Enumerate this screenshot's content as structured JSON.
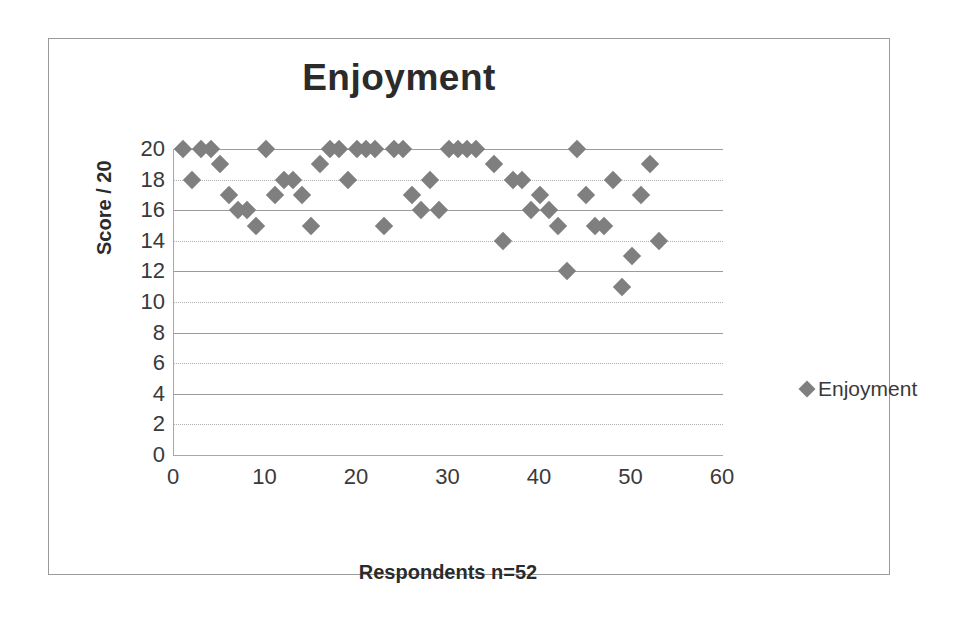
{
  "chart_data": {
    "type": "scatter",
    "title": "Enjoyment",
    "xlabel": "Respondents n=52",
    "ylabel": "Score / 20",
    "xlim": [
      0,
      60
    ],
    "ylim": [
      0,
      20
    ],
    "xticks": [
      0,
      10,
      20,
      30,
      40,
      50,
      60
    ],
    "yticks": [
      0,
      2,
      4,
      6,
      8,
      10,
      12,
      14,
      16,
      18,
      20
    ],
    "grid": "horizontal",
    "legend_position": "right",
    "marker": "diamond",
    "marker_color": "#7f7f7f",
    "series": [
      {
        "name": "Enjoyment",
        "x": [
          1,
          2,
          3,
          4,
          5,
          6,
          7,
          8,
          9,
          10,
          11,
          12,
          13,
          14,
          15,
          16,
          17,
          18,
          19,
          20,
          21,
          22,
          23,
          24,
          25,
          26,
          27,
          28,
          29,
          30,
          31,
          32,
          33,
          35,
          36,
          37,
          38,
          39,
          40,
          41,
          42,
          43,
          44,
          45,
          46,
          47,
          48,
          49,
          50,
          51,
          52,
          53
        ],
        "y": [
          20,
          18,
          20,
          20,
          19,
          17,
          16,
          16,
          15,
          20,
          17,
          18,
          18,
          17,
          15,
          19,
          20,
          20,
          18,
          20,
          20,
          20,
          15,
          20,
          20,
          17,
          16,
          18,
          16,
          20,
          20,
          20,
          20,
          19,
          14,
          18,
          18,
          16,
          17,
          16,
          15,
          12,
          20,
          17,
          15,
          15,
          18,
          11,
          13,
          17,
          19,
          14
        ]
      }
    ]
  },
  "chart": {
    "title": "Enjoyment",
    "y_axis_title": "Score / 20",
    "x_axis_title": "Respondents n=52",
    "y_tick_labels": [
      "20",
      "18",
      "16",
      "14",
      "12",
      "10",
      "8",
      "6",
      "4",
      "2",
      "0"
    ],
    "x_tick_labels": [
      "0",
      "10",
      "20",
      "30",
      "40",
      "50",
      "60"
    ],
    "legend": {
      "label": "Enjoyment",
      "marker": "diamond-marker"
    }
  }
}
